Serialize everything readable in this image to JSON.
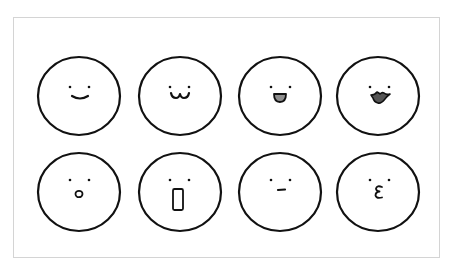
{
  "illustration": {
    "title": "",
    "frame": {
      "border_color": "#d4d4d4",
      "background": "#ffffff"
    },
    "stroke_color": "#111111",
    "faces": [
      {
        "id": "smile",
        "row": 0,
        "col": 0,
        "cx": 79,
        "cy": 95,
        "rx": 41,
        "ry": 39,
        "mouth": "smile-arc"
      },
      {
        "id": "cat-smile",
        "row": 0,
        "col": 1,
        "cx": 180,
        "cy": 95,
        "rx": 41,
        "ry": 39,
        "mouth": "w-shape"
      },
      {
        "id": "open-smile",
        "row": 0,
        "col": 2,
        "cx": 280,
        "cy": 95,
        "rx": 41,
        "ry": 39,
        "mouth": "open-grey",
        "mouth_fill": "#8f8f8f"
      },
      {
        "id": "duck-lips",
        "row": 0,
        "col": 3,
        "cx": 378,
        "cy": 95,
        "rx": 41,
        "ry": 39,
        "mouth": "duck-dark",
        "mouth_fill": "#555555"
      },
      {
        "id": "surprised-o",
        "row": 1,
        "col": 0,
        "cx": 79,
        "cy": 192,
        "rx": 41,
        "ry": 39,
        "mouth": "small-o"
      },
      {
        "id": "shocked",
        "row": 1,
        "col": 1,
        "cx": 180,
        "cy": 192,
        "rx": 41,
        "ry": 39,
        "mouth": "tall-rect"
      },
      {
        "id": "neutral",
        "row": 1,
        "col": 2,
        "cx": 280,
        "cy": 192,
        "rx": 41,
        "ry": 39,
        "mouth": "flat-line"
      },
      {
        "id": "kiss",
        "row": 1,
        "col": 3,
        "cx": 378,
        "cy": 192,
        "rx": 41,
        "ry": 39,
        "mouth": "epsilon",
        "mouth_glyph": "ε"
      }
    ]
  }
}
